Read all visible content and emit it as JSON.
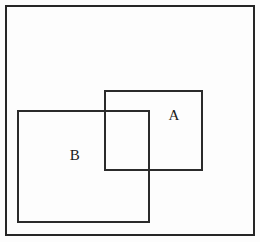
{
  "diagram": {
    "type": "set-diagram",
    "background_color": "#ffffff",
    "stroke_color": "#2b2b2b",
    "stroke_width_px": 2,
    "canvas": {
      "width": 260,
      "height": 242
    },
    "shapes": [
      {
        "name": "universal-set",
        "shape": "rectangle",
        "label": "",
        "x": 5,
        "y": 5,
        "width": 250,
        "height": 231
      },
      {
        "name": "set-a",
        "shape": "rectangle",
        "label": "A",
        "x": 104,
        "y": 90,
        "width": 99,
        "height": 81
      },
      {
        "name": "set-b",
        "shape": "rectangle",
        "label": "B",
        "x": 17,
        "y": 110,
        "width": 133,
        "height": 113
      }
    ],
    "labels": {
      "set_a": "A",
      "set_b": "B"
    }
  }
}
